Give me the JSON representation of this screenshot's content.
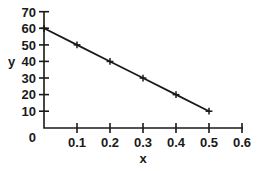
{
  "chart_data": {
    "type": "line",
    "title": "",
    "xlabel": "x",
    "ylabel": "y",
    "xlim": [
      0,
      0.6
    ],
    "ylim": [
      0,
      70
    ],
    "xticks": [
      0,
      0.1,
      0.2,
      0.3,
      0.4,
      0.5,
      0.6
    ],
    "xtick_labels": [
      "0",
      "0.1",
      "0.2",
      "0.3",
      "0.4",
      "0.5",
      "0.6"
    ],
    "yticks": [
      0,
      10,
      20,
      30,
      40,
      50,
      60,
      70
    ],
    "ytick_labels": [
      "0",
      "10",
      "20",
      "30",
      "40",
      "50",
      "60",
      "70"
    ],
    "grid": false,
    "legend": false,
    "marker": "cross",
    "line_color": "#1a1a1a",
    "series": [
      {
        "name": "",
        "x": [
          0,
          0.1,
          0.2,
          0.3,
          0.4,
          0.5
        ],
        "values": [
          60,
          50,
          40,
          30,
          20,
          10
        ]
      }
    ]
  },
  "axes": {
    "y_title": "y",
    "x_title": "x",
    "y_tick_0": "0",
    "y_tick_10": "10",
    "y_tick_20": "20",
    "y_tick_30": "30",
    "y_tick_40": "40",
    "y_tick_50": "50",
    "y_tick_60": "60",
    "y_tick_70": "70",
    "x_tick_0": "0",
    "x_tick_01": "0.1",
    "x_tick_02": "0.2",
    "x_tick_03": "0.3",
    "x_tick_04": "0.4",
    "x_tick_05": "0.5",
    "x_tick_06": "0.6"
  }
}
